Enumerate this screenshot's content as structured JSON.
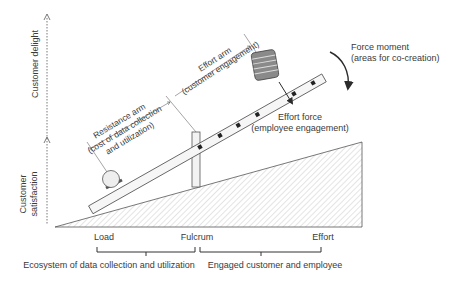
{
  "axis": {
    "upper_label": "Customer delight",
    "lower_label_line1": "Customer",
    "lower_label_line2": "satisfaction"
  },
  "lever": {
    "resistance_arm_line1": "Resistance arm",
    "resistance_arm_line2": "(cost of data collection",
    "resistance_arm_line3": "and utilization)",
    "effort_arm_line1": "Effort arm",
    "effort_arm_line2": "(customer engagement)",
    "effort_force_line1": "Effort force",
    "effort_force_line2": "(employee engagement)",
    "force_moment_line1": "Force moment",
    "force_moment_line2": "(areas for co-creation)"
  },
  "base_labels": {
    "load": "Load",
    "fulcrum": "Fulcrum",
    "effort": "Effort"
  },
  "brackets": {
    "left": "Ecosystem of data collection and utilization",
    "right": "Engaged customer and employee"
  },
  "colors": {
    "line": "#4a4a4a",
    "hatch": "#b8b8b8",
    "weight_fill": "#8a8a8a",
    "ball_fill": "#efefef",
    "beam_fill": "#f4f4f4"
  }
}
